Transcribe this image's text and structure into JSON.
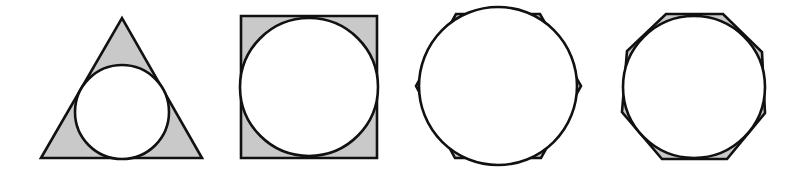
{
  "figure": {
    "colors": {
      "polygon_fill": "#c9c9c9",
      "stroke": "#111111",
      "circle_fill": "#ffffff",
      "background": "#ffffff"
    },
    "shapes": [
      {
        "name": "triangle",
        "sides": 3,
        "points": "41,158 122,18 202,158",
        "circle": {
          "cx": 122,
          "cy": 112,
          "r": 47
        }
      },
      {
        "name": "square",
        "sides": 4,
        "points": "241,16 377,16 377,158 241,158",
        "circle": {
          "cx": 309,
          "cy": 87,
          "r": 69
        }
      },
      {
        "name": "hexagon",
        "sides": 6,
        "points": "456,14 540,14 581,86 541,158 455,158 416,86",
        "circle": {
          "cx": 498,
          "cy": 86,
          "r": 79
        }
      },
      {
        "name": "octagon",
        "sides": 8,
        "points": "666,14 723,14 762,52 765,113 727,159 662,159 622,112 627,51",
        "circle": {
          "cx": 694,
          "cy": 87,
          "r": 71
        }
      }
    ]
  }
}
